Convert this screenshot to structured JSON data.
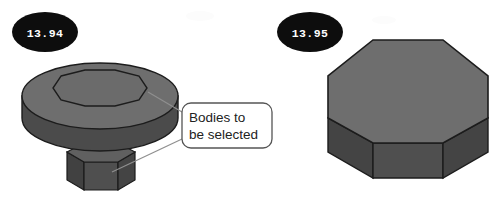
{
  "canvas": {
    "width": 502,
    "height": 202,
    "background": "#ffffff",
    "description": "Two CAD model illustrations with numbered step badges and a callout label"
  },
  "palette": {
    "badge_fill": "#0d0d0d",
    "badge_text": "#ffffff",
    "top_face": "#6e6e6e",
    "top_face_light": "#737373",
    "side_face": "#4b4b4b",
    "side_face_dark": "#424242",
    "front_face": "#535353",
    "outline": "#1c1c1c",
    "callout_stroke": "#555555",
    "callout_fill": "#ffffff",
    "callout_text": "#222222",
    "leader_line": "#8a8a8a",
    "watermark": "#fbfbfb"
  },
  "badges": [
    {
      "name": "step-badge-left",
      "label": "13.94",
      "cx": 45,
      "cy": 32,
      "rx": 33,
      "ry": 20
    },
    {
      "name": "step-badge-right",
      "label": "13.95",
      "cx": 310,
      "cy": 32,
      "rx": 33,
      "ry": 20
    }
  ],
  "callout": {
    "name": "bodies-to-be-selected-callout",
    "line1": "Bodies to",
    "line2": "be selected",
    "box": {
      "x": 182,
      "y": 103,
      "width": 90,
      "height": 45,
      "radius": 9
    },
    "leaders": [
      {
        "name": "leader-line-upper",
        "from": [
          182,
          112
        ],
        "to": [
          150,
          93
        ]
      },
      {
        "name": "leader-line-lower",
        "from": [
          182,
          139
        ],
        "to": [
          113,
          172
        ]
      }
    ]
  },
  "figures": [
    {
      "name": "flanged-hex-boss",
      "caption": "Cylindrical flange with octagonal recess on top and hexagonal shaft below",
      "parts": [
        "flange-disc",
        "octagonal-recess",
        "hex-shaft"
      ]
    },
    {
      "name": "octagonal-prism",
      "caption": "Octagonal prism viewed from above with three visible side faces",
      "parts": [
        "octagon-top-face",
        "side-face-left",
        "side-face-front",
        "side-face-right"
      ]
    }
  ],
  "watermarks": [
    {
      "name": "watermark-center",
      "text": "",
      "x": 198,
      "y": 18
    },
    {
      "name": "watermark-right",
      "text": "",
      "x": 380,
      "y": 22
    }
  ]
}
